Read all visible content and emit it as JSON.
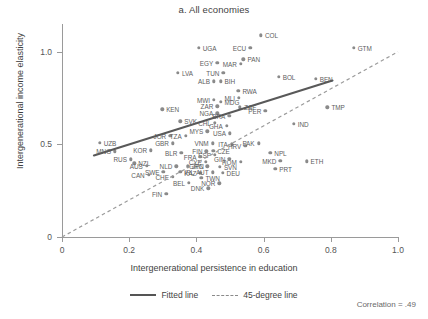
{
  "chart_data": {
    "type": "scatter",
    "title": "a. All economies",
    "xlabel": "Intergenerational persistence in education",
    "ylabel": "Intergenerational income elasticity",
    "xlim": [
      0,
      1.0
    ],
    "ylim": [
      0,
      1.15
    ],
    "xticks": [
      "0",
      "0.2",
      "0.4",
      "0.6",
      "0.8",
      "1.0"
    ],
    "xtick_values": [
      0,
      0.2,
      0.4,
      0.6,
      0.8,
      1.0
    ],
    "yticks": [
      "0",
      "0.5",
      "1.0"
    ],
    "ytick_values": [
      0,
      0.5,
      1.0
    ],
    "grid": false,
    "annotation": "Correlation = .49",
    "legend": [
      {
        "label": "Fitted line",
        "style": "solid"
      },
      {
        "label": "45-degree line",
        "style": "dashed"
      }
    ],
    "fitted_line": {
      "x0": 0.095,
      "y0": 0.44,
      "x1": 0.805,
      "y1": 0.845
    },
    "reference_line": {
      "label": "45-degree line",
      "x0": 0.0,
      "y0": 0.0,
      "x1": 1.0,
      "y1": 1.0
    },
    "points": [
      {
        "label": "COL",
        "x": 0.592,
        "y": 1.09,
        "side": "right"
      },
      {
        "label": "GTM",
        "x": 0.868,
        "y": 1.02,
        "side": "right"
      },
      {
        "label": "UGA",
        "x": 0.407,
        "y": 1.02,
        "side": "right"
      },
      {
        "label": "ECU",
        "x": 0.56,
        "y": 1.02,
        "side": "left"
      },
      {
        "label": "PAN",
        "x": 0.54,
        "y": 0.96,
        "side": "right"
      },
      {
        "label": "EGY",
        "x": 0.462,
        "y": 0.94,
        "side": "left"
      },
      {
        "label": "MAR",
        "x": 0.532,
        "y": 0.935,
        "side": "left"
      },
      {
        "label": "LVA",
        "x": 0.345,
        "y": 0.885,
        "side": "right"
      },
      {
        "label": "TUN",
        "x": 0.48,
        "y": 0.885,
        "side": "left"
      },
      {
        "label": "BOL",
        "x": 0.645,
        "y": 0.865,
        "side": "right"
      },
      {
        "label": "BEN",
        "x": 0.755,
        "y": 0.855,
        "side": "right"
      },
      {
        "label": "ALB",
        "x": 0.452,
        "y": 0.84,
        "side": "left"
      },
      {
        "label": "BIH",
        "x": 0.472,
        "y": 0.84,
        "side": "right"
      },
      {
        "label": "RWA",
        "x": 0.525,
        "y": 0.79,
        "side": "right"
      },
      {
        "label": "MLI",
        "x": 0.527,
        "y": 0.75,
        "side": "left"
      },
      {
        "label": "MWI",
        "x": 0.452,
        "y": 0.742,
        "side": "left"
      },
      {
        "label": "MDG",
        "x": 0.472,
        "y": 0.73,
        "side": "right"
      },
      {
        "label": "ZAR",
        "x": 0.462,
        "y": 0.705,
        "side": "left"
      },
      {
        "label": "ZAF",
        "x": 0.53,
        "y": 0.7,
        "side": "right"
      },
      {
        "label": "TMP",
        "x": 0.79,
        "y": 0.7,
        "side": "right"
      },
      {
        "label": "KEN",
        "x": 0.298,
        "y": 0.69,
        "side": "right"
      },
      {
        "label": "NGA",
        "x": 0.462,
        "y": 0.668,
        "side": "left"
      },
      {
        "label": "PER",
        "x": 0.605,
        "y": 0.68,
        "side": "left"
      },
      {
        "label": "BRA",
        "x": 0.498,
        "y": 0.655,
        "side": "left"
      },
      {
        "label": "SVK",
        "x": 0.352,
        "y": 0.625,
        "side": "right"
      },
      {
        "label": "CHL",
        "x": 0.455,
        "y": 0.618,
        "side": "left"
      },
      {
        "label": "IND",
        "x": 0.69,
        "y": 0.61,
        "side": "right"
      },
      {
        "label": "GHA",
        "x": 0.49,
        "y": 0.6,
        "side": "left"
      },
      {
        "label": "USA",
        "x": 0.5,
        "y": 0.56,
        "side": "left"
      },
      {
        "label": "MYS",
        "x": 0.432,
        "y": 0.57,
        "side": "left"
      },
      {
        "label": "JOR",
        "x": 0.322,
        "y": 0.545,
        "side": "left"
      },
      {
        "label": "TZA",
        "x": 0.368,
        "y": 0.545,
        "side": "left"
      },
      {
        "label": "UZB",
        "x": 0.112,
        "y": 0.51,
        "side": "right"
      },
      {
        "label": "GBR",
        "x": 0.33,
        "y": 0.505,
        "side": "left"
      },
      {
        "label": "VNM",
        "x": 0.448,
        "y": 0.505,
        "side": "left"
      },
      {
        "label": "ITA",
        "x": 0.505,
        "y": 0.5,
        "side": "left"
      },
      {
        "label": "HRV",
        "x": 0.545,
        "y": 0.492,
        "side": "left"
      },
      {
        "label": "PAK",
        "x": 0.585,
        "y": 0.505,
        "side": "left"
      },
      {
        "label": "KOR",
        "x": 0.265,
        "y": 0.468,
        "side": "left"
      },
      {
        "label": "MNG",
        "x": 0.158,
        "y": 0.462,
        "side": "left"
      },
      {
        "label": "BLR",
        "x": 0.355,
        "y": 0.455,
        "side": "left"
      },
      {
        "label": "CZE",
        "x": 0.45,
        "y": 0.465,
        "side": "right"
      },
      {
        "label": "ESP",
        "x": 0.455,
        "y": 0.445,
        "side": "left"
      },
      {
        "label": "NPL",
        "x": 0.62,
        "y": 0.455,
        "side": "right"
      },
      {
        "label": "FIN2",
        "x": 0.43,
        "y": 0.462,
        "side": "left"
      },
      {
        "label": "RUS",
        "x": 0.205,
        "y": 0.42,
        "side": "left"
      },
      {
        "label": "FRA",
        "x": 0.412,
        "y": 0.432,
        "side": "left"
      },
      {
        "label": "GIN",
        "x": 0.498,
        "y": 0.422,
        "side": "left"
      },
      {
        "label": "MKD",
        "x": 0.65,
        "y": 0.41,
        "side": "left"
      },
      {
        "label": "ETH",
        "x": 0.728,
        "y": 0.408,
        "side": "right"
      },
      {
        "label": "NZL",
        "x": 0.215,
        "y": 0.398,
        "side": "right"
      },
      {
        "label": "CYP",
        "x": 0.428,
        "y": 0.405,
        "side": "left"
      },
      {
        "label": "ROM",
        "x": 0.532,
        "y": 0.405,
        "side": "left"
      },
      {
        "label": "AUS",
        "x": 0.252,
        "y": 0.385,
        "side": "left"
      },
      {
        "label": "NLD",
        "x": 0.34,
        "y": 0.382,
        "side": "left"
      },
      {
        "label": "JPN",
        "x": 0.375,
        "y": 0.382,
        "side": "right"
      },
      {
        "label": "GRC",
        "x": 0.432,
        "y": 0.382,
        "side": "left"
      },
      {
        "label": "SVN",
        "x": 0.47,
        "y": 0.378,
        "side": "right"
      },
      {
        "label": "PRT",
        "x": 0.635,
        "y": 0.368,
        "side": "right"
      },
      {
        "label": "SWE",
        "x": 0.302,
        "y": 0.352,
        "side": "left"
      },
      {
        "label": "IRL",
        "x": 0.352,
        "y": 0.352,
        "side": "right"
      },
      {
        "label": "KAZ",
        "x": 0.412,
        "y": 0.345,
        "side": "left"
      },
      {
        "label": "AUT",
        "x": 0.448,
        "y": 0.35,
        "side": "left"
      },
      {
        "label": "DEU",
        "x": 0.478,
        "y": 0.345,
        "side": "right"
      },
      {
        "label": "CAN",
        "x": 0.258,
        "y": 0.335,
        "side": "left"
      },
      {
        "label": "CHE",
        "x": 0.33,
        "y": 0.325,
        "side": "left"
      },
      {
        "label": "TWN",
        "x": 0.415,
        "y": 0.318,
        "side": "right"
      },
      {
        "label": "BEL",
        "x": 0.378,
        "y": 0.292,
        "side": "left"
      },
      {
        "label": "NOR",
        "x": 0.468,
        "y": 0.29,
        "side": "left"
      },
      {
        "label": "DNK",
        "x": 0.435,
        "y": 0.262,
        "side": "left"
      },
      {
        "label": "FIN",
        "x": 0.31,
        "y": 0.232,
        "side": "left"
      }
    ]
  }
}
